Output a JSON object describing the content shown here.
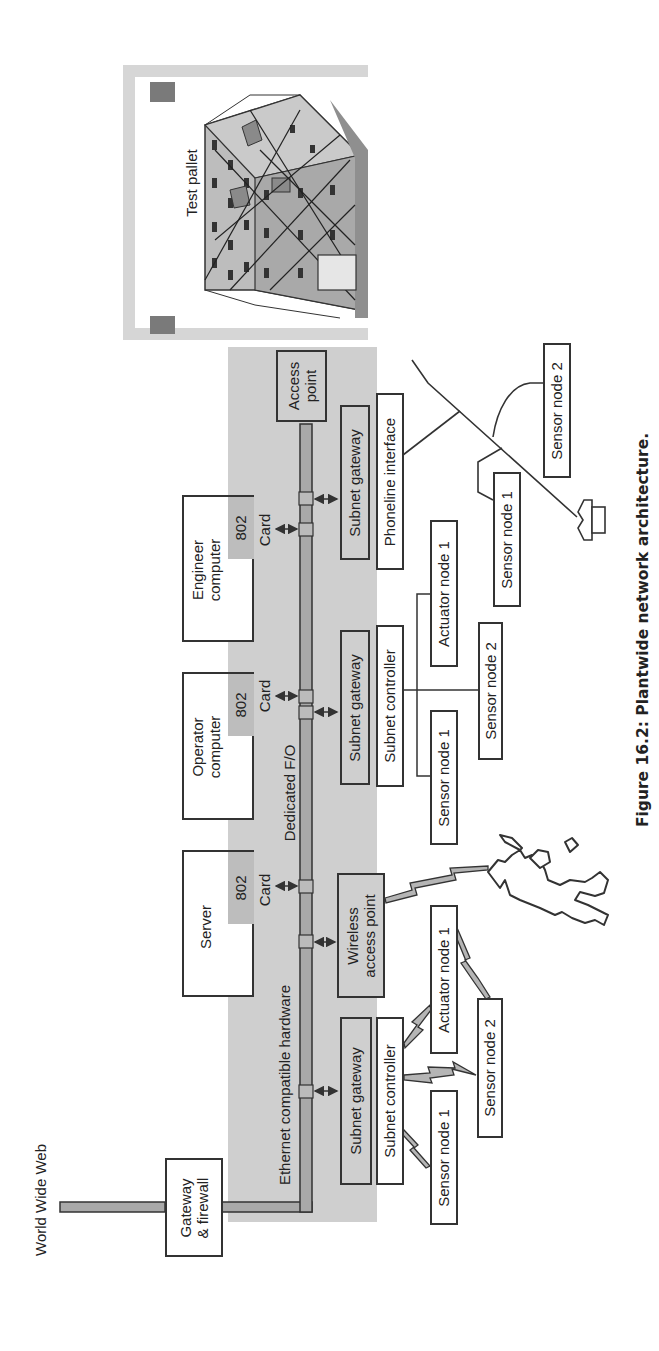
{
  "figure": {
    "caption": "Figure 16.2: Plantwide network architecture.",
    "orientation": "rotated 90° counter-clockwise"
  },
  "internet": {
    "label": "World Wide Web"
  },
  "gateway": {
    "label_line1": "Gateway",
    "label_line2": "& firewall"
  },
  "backbone": {
    "ethernet_label": "Ethernet compatible hardware",
    "fiber_label": "Dedicated F/O"
  },
  "computers": [
    {
      "name": "Server",
      "line1": "Server",
      "line2": "",
      "card_num": "802",
      "card_label": "Card"
    },
    {
      "name": "Operator computer",
      "line1": "Operator",
      "line2": "computer",
      "card_num": "802",
      "card_label": "Card"
    },
    {
      "name": "Engineer computer",
      "line1": "Engineer",
      "line2": "computer",
      "card_num": "802",
      "card_label": "Card"
    }
  ],
  "access_point": {
    "line1": "Access",
    "line2": "point"
  },
  "test_pallet": {
    "label": "Test pallet"
  },
  "subnets": {
    "wired_left": {
      "gateway": "Subnet gateway",
      "controller": "Subnet controller",
      "nodes": [
        "Sensor node 1",
        "Sensor node 2",
        "Actuator node 1"
      ],
      "link_type": "wireless"
    },
    "wireless_ap": {
      "line1": "Wireless",
      "line2": "access point"
    },
    "wired_middle": {
      "gateway": "Subnet gateway",
      "controller": "Subnet controller",
      "nodes": [
        "Sensor node 1",
        "Sensor node 2",
        "Actuator node 1"
      ],
      "link_type": "wired"
    },
    "phoneline": {
      "gateway": "Subnet gateway",
      "interface": "Phoneline interface",
      "nodes": [
        "Sensor node 1",
        "Sensor node 2"
      ]
    }
  },
  "icons": {
    "telephone": "telephone-icon",
    "worker": "walking-worker-with-handheld-icon",
    "pallet": "test-pallet-3d-icon"
  },
  "colors": {
    "panel_gray": "#cfcfcf",
    "bus_fill": "#a9a9a9",
    "line": "#333333",
    "tab_gray": "#bdbdbd"
  }
}
